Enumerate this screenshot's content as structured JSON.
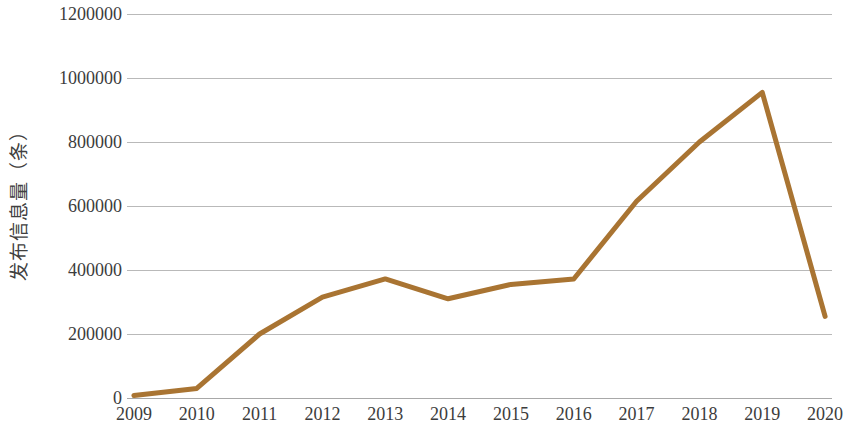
{
  "chart_data": {
    "type": "line",
    "title": "",
    "subtitle": "",
    "xlabel": "",
    "ylabel": "发布信息量（条）",
    "categories": [
      "2009",
      "2010",
      "2011",
      "2012",
      "2013",
      "2014",
      "2015",
      "2016",
      "2017",
      "2018",
      "2019",
      "2020"
    ],
    "values": [
      8000,
      30000,
      200000,
      315000,
      372000,
      310000,
      355000,
      372000,
      615000,
      800000,
      955000,
      255000
    ],
    "series": [
      {
        "name": "发布信息量（条）",
        "values": [
          8000,
          30000,
          200000,
          315000,
          372000,
          310000,
          355000,
          372000,
          615000,
          800000,
          955000,
          255000
        ],
        "color": "#A97432"
      }
    ],
    "ylim": [
      0,
      1200000
    ],
    "ytick_values": [
      0,
      200000,
      400000,
      600000,
      800000,
      1000000,
      1200000
    ],
    "ytick_labels": [
      "0",
      "200000",
      "400000",
      "600000",
      "800000",
      "1000000",
      "1200000"
    ],
    "grid": true,
    "grid_axis": "y",
    "legend": false,
    "legend_position": "none",
    "markers": false,
    "line_width": 5,
    "annotations": []
  },
  "style": {
    "line_color": "#A97432",
    "grid_color": "#b9b9b9",
    "axis_color": "#a8a8a8",
    "text_color": "#3c3c3c",
    "background": "#ffffff"
  }
}
